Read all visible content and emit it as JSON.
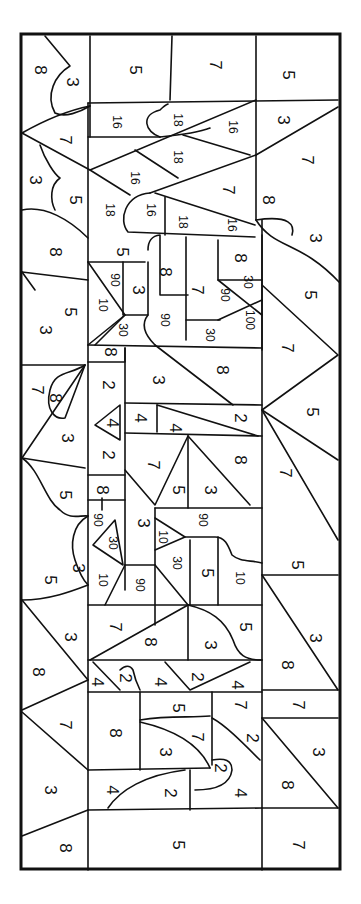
{
  "page": {
    "orientation": "rotated-90",
    "line_color": "#111111",
    "background": "#ffffff"
  },
  "regions": [
    {
      "id": "r1",
      "label": "8",
      "x": 40,
      "y": 70
    },
    {
      "id": "r2",
      "label": "3",
      "x": 72,
      "y": 82
    },
    {
      "id": "r3",
      "label": "5",
      "x": 135,
      "y": 70
    },
    {
      "id": "r4",
      "label": "7",
      "x": 215,
      "y": 65
    },
    {
      "id": "r5",
      "label": "5",
      "x": 288,
      "y": 75
    },
    {
      "id": "r6",
      "label": "16",
      "x": 117,
      "y": 122
    },
    {
      "id": "r7",
      "label": "18",
      "x": 178,
      "y": 120
    },
    {
      "id": "r8",
      "label": "16",
      "x": 233,
      "y": 127
    },
    {
      "id": "r9",
      "label": "3",
      "x": 283,
      "y": 120
    },
    {
      "id": "r10",
      "label": "7",
      "x": 65,
      "y": 140
    },
    {
      "id": "r11",
      "label": "18",
      "x": 178,
      "y": 157
    },
    {
      "id": "r12",
      "label": "3",
      "x": 35,
      "y": 180
    },
    {
      "id": "r13",
      "label": "16",
      "x": 135,
      "y": 178
    },
    {
      "id": "r14",
      "label": "7",
      "x": 228,
      "y": 190
    },
    {
      "id": "r15",
      "label": "7",
      "x": 307,
      "y": 160
    },
    {
      "id": "r16",
      "label": "5",
      "x": 75,
      "y": 200
    },
    {
      "id": "r17",
      "label": "18",
      "x": 110,
      "y": 210
    },
    {
      "id": "r18",
      "label": "16",
      "x": 151,
      "y": 210
    },
    {
      "id": "r19",
      "label": "18",
      "x": 183,
      "y": 222
    },
    {
      "id": "r20",
      "label": "16",
      "x": 232,
      "y": 225
    },
    {
      "id": "r21",
      "label": "8",
      "x": 268,
      "y": 200
    },
    {
      "id": "r22",
      "label": "3",
      "x": 315,
      "y": 238
    },
    {
      "id": "r23",
      "label": "8",
      "x": 55,
      "y": 252
    },
    {
      "id": "r24",
      "label": "5",
      "x": 122,
      "y": 252
    },
    {
      "id": "r25",
      "label": "8",
      "x": 165,
      "y": 272
    },
    {
      "id": "r26",
      "label": "8",
      "x": 240,
      "y": 258
    },
    {
      "id": "r27",
      "label": "90",
      "x": 115,
      "y": 280
    },
    {
      "id": "r28",
      "label": "3",
      "x": 138,
      "y": 290
    },
    {
      "id": "r29",
      "label": "7",
      "x": 197,
      "y": 290
    },
    {
      "id": "r30",
      "label": "90",
      "x": 225,
      "y": 295
    },
    {
      "id": "r31",
      "label": "30",
      "x": 248,
      "y": 282
    },
    {
      "id": "r32",
      "label": "5",
      "x": 310,
      "y": 295
    },
    {
      "id": "r33",
      "label": "3",
      "x": 45,
      "y": 330
    },
    {
      "id": "r34",
      "label": "5",
      "x": 70,
      "y": 312
    },
    {
      "id": "r35",
      "label": "10",
      "x": 103,
      "y": 305
    },
    {
      "id": "r36",
      "label": "30",
      "x": 123,
      "y": 330
    },
    {
      "id": "r37",
      "label": "90",
      "x": 165,
      "y": 320
    },
    {
      "id": "r38",
      "label": "30",
      "x": 210,
      "y": 335
    },
    {
      "id": "r39",
      "label": "100",
      "x": 250,
      "y": 320
    },
    {
      "id": "r40",
      "label": "8",
      "x": 110,
      "y": 352
    },
    {
      "id": "r41",
      "label": "7",
      "x": 287,
      "y": 348
    },
    {
      "id": "r42",
      "label": "7",
      "x": 37,
      "y": 390
    },
    {
      "id": "r43",
      "label": "8",
      "x": 55,
      "y": 398
    },
    {
      "id": "r44",
      "label": "2",
      "x": 108,
      "y": 385
    },
    {
      "id": "r45",
      "label": "3",
      "x": 158,
      "y": 380
    },
    {
      "id": "r46",
      "label": "8",
      "x": 222,
      "y": 370
    },
    {
      "id": "r47",
      "label": "4",
      "x": 112,
      "y": 423
    },
    {
      "id": "r48",
      "label": "4",
      "x": 140,
      "y": 418
    },
    {
      "id": "r49",
      "label": "4",
      "x": 175,
      "y": 428
    },
    {
      "id": "r50",
      "label": "2",
      "x": 240,
      "y": 418
    },
    {
      "id": "r51",
      "label": "5",
      "x": 312,
      "y": 412
    },
    {
      "id": "r52",
      "label": "3",
      "x": 67,
      "y": 438
    },
    {
      "id": "r53",
      "label": "2",
      "x": 108,
      "y": 455
    },
    {
      "id": "r54",
      "label": "7",
      "x": 153,
      "y": 465
    },
    {
      "id": "r55",
      "label": "8",
      "x": 240,
      "y": 460
    },
    {
      "id": "r56",
      "label": "5",
      "x": 65,
      "y": 495
    },
    {
      "id": "r57",
      "label": "8",
      "x": 102,
      "y": 490
    },
    {
      "id": "r58",
      "label": "5",
      "x": 178,
      "y": 490
    },
    {
      "id": "r59",
      "label": "3",
      "x": 210,
      "y": 490
    },
    {
      "id": "r60",
      "label": "7",
      "x": 285,
      "y": 473
    },
    {
      "id": "r61",
      "label": "90",
      "x": 98,
      "y": 520
    },
    {
      "id": "r62",
      "label": "30",
      "x": 113,
      "y": 543
    },
    {
      "id": "r63",
      "label": "3",
      "x": 143,
      "y": 523
    },
    {
      "id": "r64",
      "label": "10",
      "x": 163,
      "y": 537
    },
    {
      "id": "r65",
      "label": "90",
      "x": 203,
      "y": 520
    },
    {
      "id": "r66",
      "label": "3",
      "x": 78,
      "y": 568
    },
    {
      "id": "r67",
      "label": "5",
      "x": 50,
      "y": 580
    },
    {
      "id": "r68",
      "label": "10",
      "x": 103,
      "y": 580
    },
    {
      "id": "r69",
      "label": "90",
      "x": 140,
      "y": 585
    },
    {
      "id": "r70",
      "label": "30",
      "x": 177,
      "y": 563
    },
    {
      "id": "r71",
      "label": "5",
      "x": 207,
      "y": 573
    },
    {
      "id": "r72",
      "label": "10",
      "x": 240,
      "y": 578
    },
    {
      "id": "r73",
      "label": "5",
      "x": 297,
      "y": 565
    },
    {
      "id": "r74",
      "label": "3",
      "x": 70,
      "y": 637
    },
    {
      "id": "r75",
      "label": "7",
      "x": 115,
      "y": 627
    },
    {
      "id": "r76",
      "label": "8",
      "x": 150,
      "y": 642
    },
    {
      "id": "r77",
      "label": "3",
      "x": 210,
      "y": 645
    },
    {
      "id": "r78",
      "label": "5",
      "x": 245,
      "y": 627
    },
    {
      "id": "r79",
      "label": "3",
      "x": 315,
      "y": 638
    },
    {
      "id": "r80",
      "label": "8",
      "x": 38,
      "y": 672
    },
    {
      "id": "r81",
      "label": "4",
      "x": 97,
      "y": 682
    },
    {
      "id": "r82",
      "label": "2",
      "x": 125,
      "y": 678
    },
    {
      "id": "r83",
      "label": "4",
      "x": 160,
      "y": 682
    },
    {
      "id": "r84",
      "label": "2",
      "x": 197,
      "y": 677
    },
    {
      "id": "r85",
      "label": "4",
      "x": 237,
      "y": 685
    },
    {
      "id": "r86",
      "label": "8",
      "x": 287,
      "y": 665
    },
    {
      "id": "r87",
      "label": "7",
      "x": 65,
      "y": 725
    },
    {
      "id": "r88",
      "label": "5",
      "x": 178,
      "y": 708
    },
    {
      "id": "r89",
      "label": "7",
      "x": 240,
      "y": 705
    },
    {
      "id": "r90",
      "label": "7",
      "x": 298,
      "y": 705
    },
    {
      "id": "r91",
      "label": "8",
      "x": 115,
      "y": 733
    },
    {
      "id": "r92",
      "label": "3",
      "x": 165,
      "y": 752
    },
    {
      "id": "r93",
      "label": "7",
      "x": 197,
      "y": 737
    },
    {
      "id": "r94",
      "label": "2",
      "x": 252,
      "y": 738
    },
    {
      "id": "r95",
      "label": "3",
      "x": 318,
      "y": 752
    },
    {
      "id": "r96",
      "label": "3",
      "x": 50,
      "y": 790
    },
    {
      "id": "r97",
      "label": "4",
      "x": 112,
      "y": 790
    },
    {
      "id": "r98",
      "label": "2",
      "x": 170,
      "y": 793
    },
    {
      "id": "r99",
      "label": "2",
      "x": 220,
      "y": 768
    },
    {
      "id": "r100",
      "label": "4",
      "x": 240,
      "y": 793
    },
    {
      "id": "r101",
      "label": "8",
      "x": 287,
      "y": 785
    },
    {
      "id": "r102",
      "label": "8",
      "x": 65,
      "y": 848
    },
    {
      "id": "r103",
      "label": "5",
      "x": 178,
      "y": 845
    },
    {
      "id": "r104",
      "label": "7",
      "x": 298,
      "y": 845
    }
  ]
}
